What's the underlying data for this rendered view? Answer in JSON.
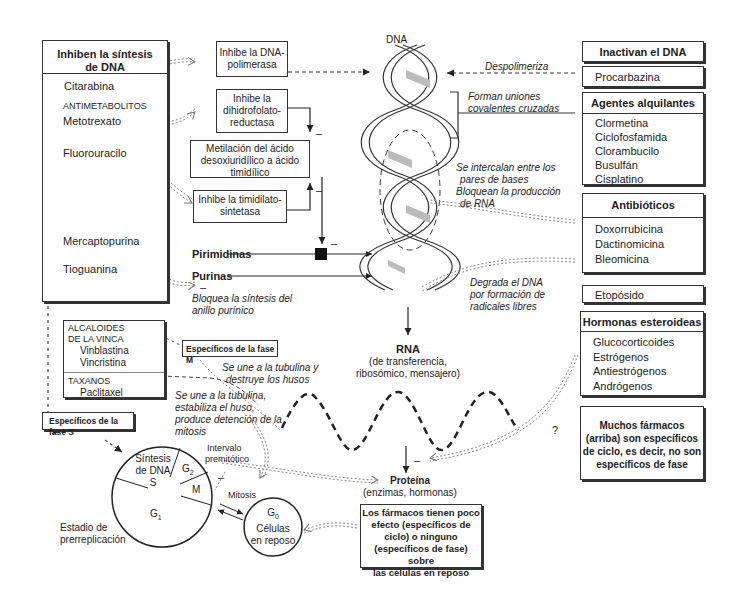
{
  "left_panel": {
    "title": "Inhiben la síntesis de DNA",
    "title_line1": "Inhiben la síntesis",
    "title_line2": "de DNA",
    "items": [
      {
        "label": "Citarabina"
      },
      {
        "label": "ANTIMETABOLITOS"
      },
      {
        "label": "Metotrexato"
      },
      {
        "label": "Fluorouracilo"
      },
      {
        "label": "Mercaptopurina"
      },
      {
        "label": "Tioguanina"
      }
    ]
  },
  "mechanism_boxes": {
    "dna_polimerasa": {
      "line1": "Inhibe la DNA-",
      "line2": "polimerasa"
    },
    "dihidrofolato": {
      "line1": "Inhibe la",
      "line2": "dihidrofolato-",
      "line3": "reductasa"
    },
    "metilacion": {
      "line1": "Metilación del ácido",
      "line2": "desoxiuridílico a ácido",
      "line3": "timidílico"
    },
    "timidilato": {
      "line1": "Inhibe la timidilato-",
      "line2": "sintetasa"
    }
  },
  "pathway": {
    "pirimidinas": "Pirimidinas",
    "purinas": "Purinas",
    "bloquea_line1": "Bloquea la síntesis del",
    "bloquea_line2": "anillo purínico",
    "minus": "–"
  },
  "dna": {
    "label": "DNA",
    "despolimeriza": "Despolimeriza",
    "forman_line1": "Forman uniones",
    "forman_line2": "covalentes cruzadas",
    "intercalan_line1": "Se intercalan entre los",
    "intercalan_line2": "pares de bases",
    "intercalan_line3": "Bloquean la producción",
    "intercalan_line4": "de RNA",
    "degrada_line1": "Degrada el DNA",
    "degrada_line2": "por formación de",
    "degrada_line3": "radicales libres"
  },
  "rna": {
    "label": "RNA",
    "sub_line1": "(de transferencia,",
    "sub_line2": "ribosómico, mensajero)"
  },
  "protein": {
    "label": "Proteína",
    "sub": "(enzimas, hormonas)"
  },
  "right_panel": {
    "inactivan": {
      "title": "Inactivan el DNA",
      "items": [
        "Procarbazina"
      ]
    },
    "alquilantes": {
      "title": "Agentes alquilantes",
      "items": [
        "Clormetina",
        "Ciclofosfamida",
        "Clorambucilo",
        "Busulfán",
        "Cisplatino"
      ]
    },
    "antibioticos": {
      "title": "Antibióticos",
      "items": [
        "Doxorrubicina",
        "Dactinomicina",
        "Bleomicina"
      ]
    },
    "etoposido": {
      "items": [
        "Etopósido"
      ]
    },
    "hormonas": {
      "title": "Hormonas esteroideas",
      "items": [
        "Glucocorticoides",
        "Estrógenos",
        "Antiestrógenos",
        "Andrógenos"
      ]
    },
    "muchos": {
      "line1": "Muchos fármacos",
      "line2": "(arriba) son específicos",
      "line3": "de ciclo, es decir, no son",
      "line4": "específicos de fase"
    }
  },
  "vinca": {
    "title_line1": "ALCALOIDES",
    "title_line2": "DE LA VINCA",
    "items": [
      "Vinblastina",
      "Vincristina"
    ],
    "taxanos": "TAXANOS",
    "taxanos_items": [
      "Paclitaxel"
    ]
  },
  "fase_m": {
    "label": "Específicos de la fase M"
  },
  "fase_s": {
    "label": "Específicos de la fase S"
  },
  "tubulina_destruye": {
    "line1": "Se une a la tubulina y",
    "line2": "destruye los husos"
  },
  "tubulina_estabiliza": {
    "line1": "Se une a la tubulina,",
    "line2": "estabiliza el huso,",
    "line3": "produce detención de la",
    "line4": "mitosis"
  },
  "cell_cycle": {
    "s_line1": "Síntesis",
    "s_line2": "de DNA",
    "s_line3": "S",
    "g2": "G",
    "g2_sub": "2",
    "m": "M",
    "g1": "G",
    "g1_sub": "1",
    "intervalo_line1": "Intervalo",
    "intervalo_line2": "premitótico",
    "mitosis": "Mitosis",
    "estadio_line1": "Estadio de",
    "estadio_line2": "prerreplicación",
    "g0": "G",
    "g0_sub": "0",
    "g0_line2": "Células",
    "g0_line3": "en reposo",
    "minus": "–"
  },
  "resting_note": {
    "line1": "Los fármacos tienen poco",
    "line2": "efecto (específicos de",
    "line3": "ciclo) o ninguno",
    "line4": "(específicos de fase) sobre",
    "line5": "las células en reposo"
  },
  "question_mark": "?",
  "minus_sign": "–",
  "colors": {
    "line": "#333333",
    "helix_fill": "#bbbbbb",
    "background": "#ffffff"
  }
}
